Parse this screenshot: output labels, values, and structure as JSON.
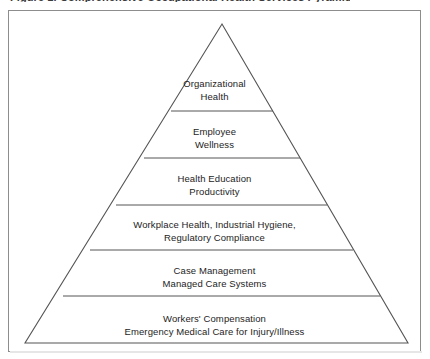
{
  "figure": {
    "caption_cutoff": "Figure 1. Comprehensive Occupational Health Services Pyramid",
    "frame_color": "#8d8d8d",
    "line_color": "#555555",
    "text_color": "#1d1d1d",
    "background": "#ffffff"
  },
  "diagram": {
    "type": "pyramid",
    "tier_count": 6,
    "apex": {
      "x": 214,
      "y": 14
    },
    "base": {
      "left_x": 17,
      "right_x": 400,
      "y": 333
    },
    "divider_y": [
      101,
      148,
      195,
      240,
      286
    ],
    "tiers": [
      {
        "index": 1,
        "position": "apex",
        "lines": [
          "Organizational",
          "Health"
        ],
        "text": "Organizational\nHealth"
      },
      {
        "index": 2,
        "position": "second",
        "lines": [
          "Employee",
          "Wellness"
        ],
        "text": "Employee\nWellness"
      },
      {
        "index": 3,
        "position": "third",
        "lines": [
          "Health Education",
          "Productivity"
        ],
        "text": "Health Education\nProductivity"
      },
      {
        "index": 4,
        "position": "fourth",
        "lines": [
          "Workplace Health, Industrial Hygiene,",
          "Regulatory Compliance"
        ],
        "text": "Workplace Health, Industrial Hygiene,\nRegulatory Compliance"
      },
      {
        "index": 5,
        "position": "fifth",
        "lines": [
          "Case Management",
          "Managed Care Systems"
        ],
        "text": "Case Management\nManaged Care Systems"
      },
      {
        "index": 6,
        "position": "base",
        "lines": [
          "Workers' Compensation",
          "Emergency Medical Care for Injury/Illness"
        ],
        "text": "Workers' Compensation\nEmergency Medical Care for Injury/Illness"
      }
    ]
  }
}
